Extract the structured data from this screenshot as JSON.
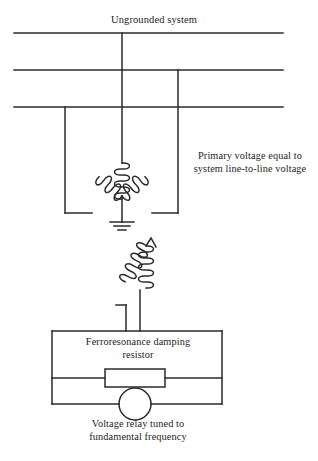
{
  "diagram": {
    "title": "Ungrounded system",
    "type": "electrical-schematic",
    "stroke_color": "#2b2b2b",
    "background_color": "#ffffff",
    "labels": {
      "title": "Ungrounded system",
      "primary_voltage": "Primary voltage equal to\nsystem line-to-line voltage",
      "damping_resistor": "Ferroresonance damping\nresistor",
      "voltage_relay": "Voltage relay tuned to\nfundamental frequency"
    },
    "components": {
      "bus_lines": [
        {
          "name": "phase-a-bus",
          "y": 33
        },
        {
          "name": "phase-b-bus",
          "y": 70
        },
        {
          "name": "phase-c-bus",
          "y": 107
        }
      ],
      "drops": [
        {
          "name": "phase-a-drop",
          "x": 122
        },
        {
          "name": "phase-b-drop",
          "x": 178
        },
        {
          "name": "phase-c-drop",
          "x": 65
        }
      ],
      "primary_winding": "wye-connected-primary",
      "ground": "neutral-ground-symbol",
      "secondary_winding": "broken-delta-secondary",
      "resistor": "ferroresonance-damping-resistor",
      "relay": "voltage-relay"
    }
  }
}
